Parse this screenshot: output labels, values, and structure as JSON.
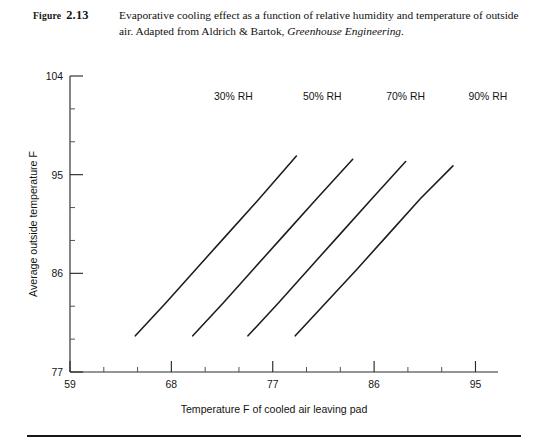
{
  "figure": {
    "label_prefix": "Figure",
    "number": "2.13",
    "caption_part1": "Evaporative cooling effect as a function of relative humidity and temperature of outside air. Adapted from Aldrich & Bartok, ",
    "caption_italic": "Greenhouse Engineering",
    "caption_end": "."
  },
  "chart_data": {
    "type": "line",
    "title": "",
    "xlabel": "Temperature F of cooled air leaving pad",
    "ylabel": "Average outside temperature F",
    "xlim": [
      59,
      97
    ],
    "ylim": [
      77,
      104
    ],
    "xticks": [
      59,
      68,
      77,
      86,
      95
    ],
    "yticks": [
      77,
      86,
      95,
      104
    ],
    "xtick_labels": [
      "59",
      "68",
      "77",
      "86",
      "95"
    ],
    "ytick_labels": [
      "77",
      "86",
      "95",
      "104"
    ],
    "x_minor_step": 3,
    "y_minor_step": 3,
    "grid": false,
    "legend": "inline-end-labels",
    "series": [
      {
        "name": "30% RH",
        "label": "30% RH",
        "label_x": 73.5,
        "label_y": 101.8,
        "x": [
          64.8,
          67.5,
          70.2,
          73.0,
          75.8,
          79.1
        ],
        "y": [
          80.3,
          83.3,
          86.4,
          89.6,
          92.8,
          96.7
        ]
      },
      {
        "name": "50% RH",
        "label": "50% RH",
        "label_x": 81.4,
        "label_y": 101.8,
        "x": [
          69.9,
          72.6,
          75.3,
          78.1,
          80.9,
          84.1
        ],
        "y": [
          80.3,
          83.3,
          86.4,
          89.6,
          92.8,
          96.4
        ]
      },
      {
        "name": "70% RH",
        "label": "70% RH",
        "label_x": 88.8,
        "label_y": 101.8,
        "x": [
          74.8,
          77.5,
          80.2,
          83.0,
          85.8,
          88.8
        ],
        "y": [
          80.3,
          83.3,
          86.4,
          89.6,
          92.8,
          96.2
        ]
      },
      {
        "name": "90% RH",
        "label": "90% RH",
        "label_x": 96.1,
        "label_y": 101.8,
        "x": [
          79.0,
          81.7,
          84.5,
          87.3,
          90.1,
          93.0
        ],
        "y": [
          80.3,
          83.3,
          86.4,
          89.6,
          92.8,
          95.8
        ]
      }
    ]
  }
}
